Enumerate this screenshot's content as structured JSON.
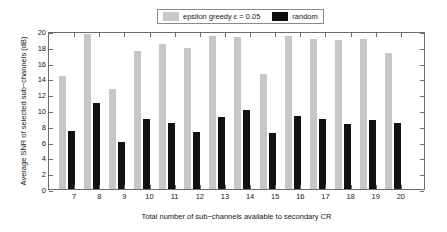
{
  "chart_data": {
    "type": "bar",
    "title": "",
    "xlabel": "Total number of sub−channels available to secondary CR",
    "ylabel": "Average SNR of selected sub−channels (dB)",
    "categories": [
      "7",
      "8",
      "9",
      "10",
      "11",
      "12",
      "13",
      "14",
      "15",
      "16",
      "17",
      "18",
      "19",
      "20"
    ],
    "series": [
      {
        "name": "epsilon greedy ε = 0.05",
        "color": "#c6c6c6",
        "values": [
          14.3,
          19.6,
          12.7,
          17.5,
          18.4,
          17.9,
          19.4,
          19.25,
          14.5,
          19.4,
          19.05,
          18.8,
          19.05,
          17.2
        ]
      },
      {
        "name": "random",
        "color": "#111111",
        "values": [
          7.3,
          10.9,
          6.0,
          8.9,
          8.35,
          7.25,
          9.1,
          10.05,
          7.05,
          9.25,
          8.8,
          8.2,
          8.75,
          8.3
        ]
      }
    ],
    "ylim": [
      0,
      20
    ],
    "yticks": [
      0,
      2,
      4,
      6,
      8,
      10,
      12,
      14,
      16,
      18,
      20
    ],
    "ytick_labels": [
      "0",
      "2",
      "4",
      "6",
      "8",
      "10",
      "12",
      "14",
      "16",
      "18",
      "20"
    ],
    "grid": false,
    "legend_position": "top-center"
  },
  "legend": {
    "entries": [
      {
        "label": "epsilon greedy ε = 0.05",
        "swatch": "greedy"
      },
      {
        "label": "random",
        "swatch": "random"
      }
    ]
  }
}
